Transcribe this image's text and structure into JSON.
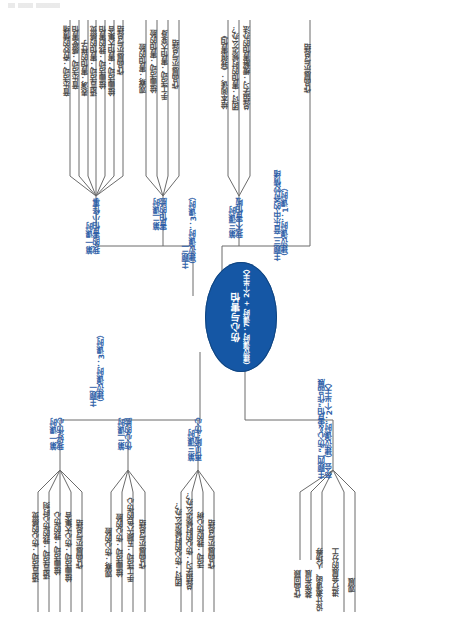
{
  "diagram": {
    "type": "mind-map",
    "orientation": "rotated-90-ccw",
    "center": {
      "title": "伤心与害怕",
      "subtitle": "（建议课时：7课时 + 2个半天）",
      "color": "#1557a5"
    },
    "branch_color": "#2f5fa8",
    "leaf_color": "#4a4a4a",
    "topics": [
      {
        "id": "topic-2",
        "label": "主题二",
        "sublabel": "（建议课时：3课时）",
        "branches": [
          {
            "id": "t2-b1",
            "label": "第一课时",
            "sublabel": "我的害怕小怪事",
            "leaves": [
              "音乐活动：奇妙的情绪",
              "音乐活动：感受害怕",
              "表演：害怕的样子",
              "语言活动：害怕的感觉",
              "绘画活动：我的害怕",
              "绘画活动：害怕大集合",
              "作品展示与总结"
            ]
          },
          {
            "id": "t2-b2",
            "label": "第二课时",
            "sublabel": "害怕的脸",
            "leaves": [
              "观察：害怕的脸",
              "绘画活动：害怕的脸",
              "手工活动：害怕大变身",
              "作品展示与总结"
            ]
          },
          {
            "id": "t2-b3",
            "label": "第三课时",
            "sublabel": "我不害怕啦",
            "leaves": [
              "绘本阅读：《我很害怕》",
              "团讨：害怕的时候怎么办？",
              "总结学习：缓解害怕的办法"
            ]
          }
        ]
      },
      {
        "id": "topic-3",
        "label": "主题三 音乐中的奇妙情绪",
        "sublabel": "（建议课时：1课时）",
        "branches": [
          {
            "id": "t3-b1",
            "label": "",
            "sublabel": "",
            "leaves": [
              "作品展示与总结"
            ]
          }
        ]
      },
      {
        "id": "topic-1",
        "label": "主题一",
        "sublabel": "（建议课时：3课时）",
        "branches": [
          {
            "id": "t1-b1",
            "label": "第一课时",
            "sublabel": "我好伤心",
            "leaves": [
              "语言活动：伤心的感觉",
              "语言活动：我的伤心时刻",
              "绘画活动：我的伤心",
              "绘画活动：伤心大集合",
              "作品展示与总结"
            ]
          },
          {
            "id": "t1-b2",
            "label": "第二课时",
            "sublabel": "伤心的脸",
            "leaves": [
              "观察：伤心的脸",
              "绘画活动：伤心的脸",
              "手工活动：五颜六色的伤心",
              "作品展示与总结"
            ]
          },
          {
            "id": "t1-b3",
            "label": "第三课时",
            "sublabel": "再见啦·伤心",
            "leaves": [
              "团讨：伤心的时候怎么办？",
              "总结学习：伤心的时候怎么办？",
              "活动：我的伤心树",
              "作品展示与总结"
            ]
          }
        ]
      },
      {
        "id": "topic-4",
        "label": "主题四 “伤心＆害怕”作品展",
        "sublabel": "布会（建议课时：2个半天）",
        "branches": [
          {
            "id": "t4-b1",
            "label": "",
            "sublabel": "",
            "leaves": [
              "作品回顾",
              "装饰布展",
              "设计邀请函、人场券",
              "进行会展的分工",
              "观展"
            ]
          }
        ]
      }
    ]
  }
}
